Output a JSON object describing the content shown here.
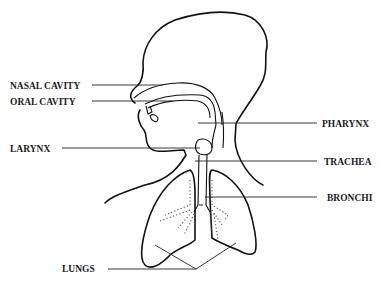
{
  "diagram": {
    "labels": {
      "nasal_cavity": "NASAL CAVITY",
      "oral_cavity": "ORAL CAVITY",
      "larynx": "LARYNX",
      "pharynx": "PHARYNX",
      "trachea": "TRACHEA",
      "bronchi": "BRONCHI",
      "lungs": "LUNGS"
    }
  }
}
